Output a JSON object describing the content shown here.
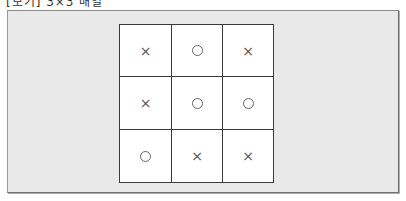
{
  "caption": "[보기] 3×3 배열",
  "grid": {
    "rows": 3,
    "cols": 3,
    "cells": [
      [
        "×",
        "○",
        "×"
      ],
      [
        "×",
        "○",
        "○"
      ],
      [
        "○",
        "×",
        "×"
      ]
    ]
  },
  "colors": {
    "panel_background": "#e9e9e9",
    "grid_background": "#ffffff",
    "grid_line": "#3a3a3a",
    "mark": "#555555"
  }
}
